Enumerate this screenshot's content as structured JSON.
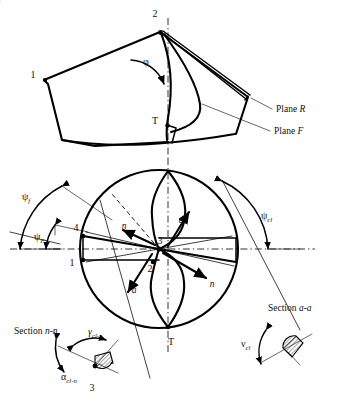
{
  "figure": {
    "background": "#ffffff",
    "ink": "#000000"
  },
  "top_view": {
    "name": "side-view-drill-point",
    "labels": {
      "point_2": "2",
      "point_1": "1",
      "point_T": "T",
      "angle_phi": "φ",
      "plane_r": "Plane R",
      "plane_f": "Plane F"
    }
  },
  "end_view": {
    "name": "end-view-drill-circle",
    "labels": {
      "psi_f": "ψ",
      "psi_f_sub": "f",
      "psi_F": "ψ",
      "psi_F_sub": "F",
      "psi_cl": "ψ",
      "psi_cl_sub": "cl",
      "point_1": "1",
      "point_2": "2",
      "point_3": "3",
      "point_4": "4",
      "point_T": "T",
      "section_arrow_a_top": "a",
      "section_arrow_a_bottom": "a",
      "section_arrow_n_left": "n",
      "section_arrow_n_right": "n"
    }
  },
  "section_nn": {
    "name": "section-n-n",
    "labels": {
      "caption": "Section ",
      "caption_it": "n-n",
      "gamma": "γ",
      "gamma_sub": "cl-n",
      "alpha": "α",
      "alpha_sub": "cl-n",
      "point_3": "3"
    }
  },
  "section_aa": {
    "name": "section-a-a",
    "labels": {
      "caption": "Section ",
      "caption_it": "a-a",
      "nu": "ν",
      "nu_sub": "cl"
    }
  }
}
